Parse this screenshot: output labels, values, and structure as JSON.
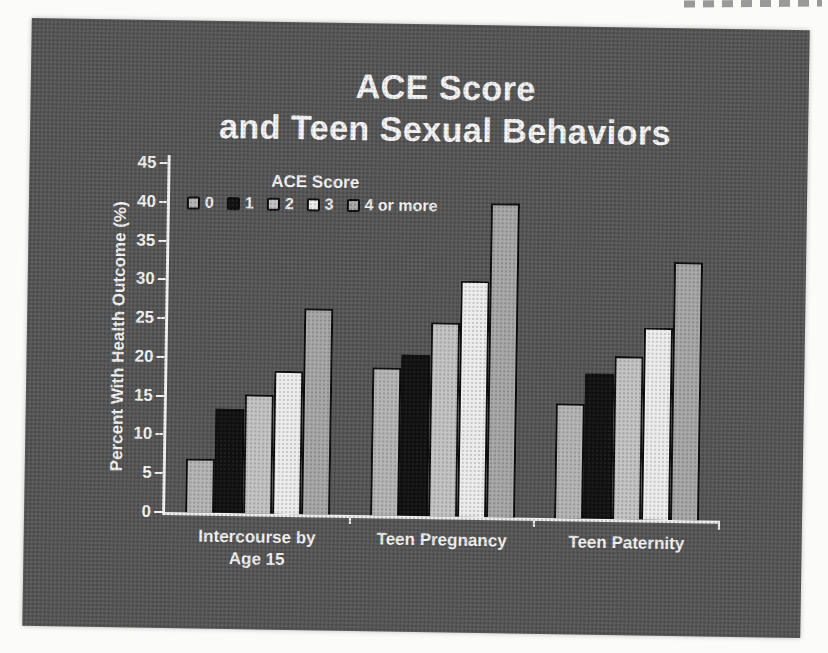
{
  "page": {
    "background_color": "#fbfbfa"
  },
  "slide": {
    "background_color": "#565656",
    "text_color": "#f1f1f1",
    "title_line1": "ACE Score",
    "title_line2": "and Teen Sexual Behaviors"
  },
  "chart_data": {
    "type": "bar",
    "title": "ACE Score and Teen Sexual Behaviors",
    "xlabel": "",
    "ylabel": "Percent With Health Outcome (%)",
    "ylim": [
      0,
      45
    ],
    "yticks": [
      0,
      5,
      10,
      15,
      20,
      25,
      30,
      35,
      40,
      45
    ],
    "grid": false,
    "legend_title": "ACE Score",
    "legend_position": "upper-left-inside",
    "axis_color": "#efefef",
    "bar_outline_color": "#0d0d0d",
    "categories": [
      "Intercourse by Age 15",
      "Teen Pregnancy",
      "Teen Paternity"
    ],
    "category_label_lines": [
      [
        "Intercourse by",
        "Age 15"
      ],
      [
        "Teen Pregnancy"
      ],
      [
        "Teen Paternity"
      ]
    ],
    "series": [
      {
        "name": "0",
        "color": "#b4b4b4",
        "values": [
          7.0,
          19.1,
          14.8
        ]
      },
      {
        "name": "1",
        "color": "#121212",
        "values": [
          13.4,
          20.8,
          18.7
        ]
      },
      {
        "name": "2",
        "color": "#c2c2c2",
        "values": [
          15.3,
          25.0,
          21.0
        ]
      },
      {
        "name": "3",
        "color": "#ececec",
        "values": [
          18.4,
          30.4,
          24.7
        ]
      },
      {
        "name": "4 or more",
        "color": "#a6a6a6",
        "values": [
          26.6,
          40.5,
          33.3
        ]
      }
    ]
  }
}
